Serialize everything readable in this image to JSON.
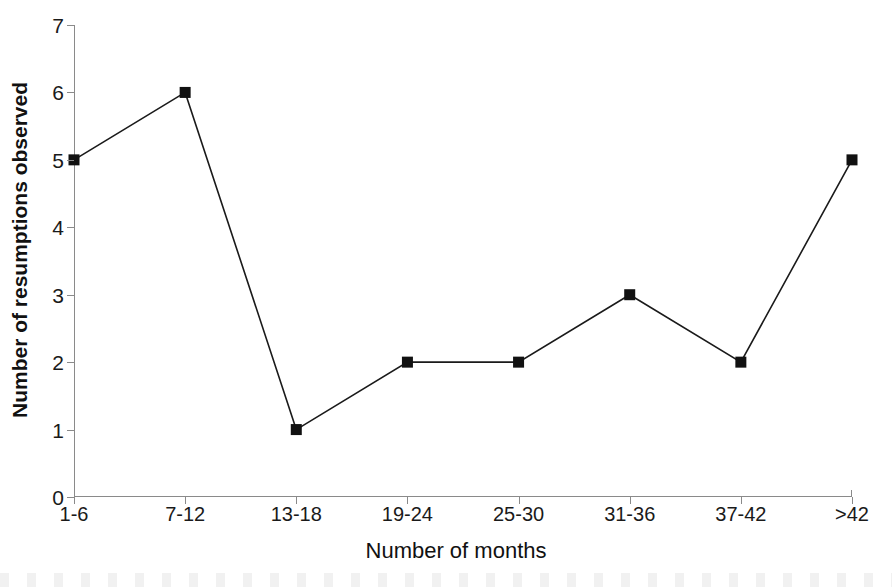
{
  "chart_data": {
    "type": "line",
    "title": "",
    "xlabel": "Number of months",
    "ylabel": "Number of resumptions observed",
    "categories": [
      "1-6",
      "7-12",
      "13-18",
      "19-24",
      "25-30",
      "31-36",
      "37-42",
      ">42"
    ],
    "values": [
      5,
      6,
      1,
      2,
      2,
      3,
      2,
      5
    ],
    "ylim": [
      0,
      7
    ],
    "y_ticks": [
      0,
      1,
      2,
      3,
      4,
      5,
      6,
      7
    ],
    "y_tick_labels": [
      "0",
      "1",
      "2",
      "3",
      "4",
      "5",
      "6",
      "7"
    ],
    "grid": false,
    "legend": null,
    "legend_position": "none",
    "marker": "square",
    "marker_color": "#111111",
    "line_color": "#1a1a1a",
    "axis_color": "#8a8a8a",
    "background": "#ffffff"
  }
}
